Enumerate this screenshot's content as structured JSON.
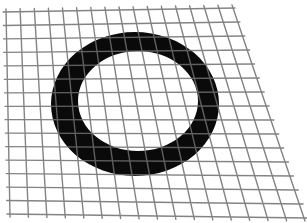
{
  "figure": {
    "background": "#ffffff",
    "grid_color": "#6e6e6e",
    "grid_over_ring_color": "#9a9a9a",
    "ring_color": "#0a0a0a",
    "grid": {
      "vertical_lines": 17,
      "horizontal_lines": 16,
      "top_left": [
        6,
        12
      ],
      "top_right": [
        232,
        8
      ],
      "bottom_left": [
        10,
        214
      ],
      "bottom_right": [
        305,
        218
      ]
    },
    "ring": {
      "outer": {
        "cx": 135,
        "cy": 104,
        "rx": 84,
        "ry": 72
      },
      "inner": {
        "cx": 138,
        "cy": 101,
        "rx": 60,
        "ry": 50
      }
    }
  }
}
